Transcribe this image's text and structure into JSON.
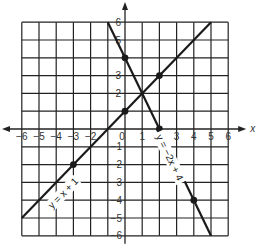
{
  "figure": {
    "x_axis_label": "x",
    "y_axis_label": "y",
    "x_ticks": [
      "−6",
      "−5",
      "−4",
      "−3",
      "−2",
      "0",
      "1",
      "2",
      "3",
      "4",
      "5",
      "6"
    ],
    "y_ticks_pos": [
      "6",
      "5",
      "3",
      "2"
    ],
    "y_ticks_neg": [
      "−1",
      "−2",
      "−3",
      "−4",
      "−5",
      "−6"
    ],
    "line1_label": "y = x + 1",
    "line2_label": "y = −2x + 4"
  },
  "chart_data": {
    "type": "line",
    "title": "",
    "xlabel": "x",
    "ylabel": "y",
    "xlim": [
      -6,
      6
    ],
    "ylim": [
      -6,
      6
    ],
    "grid": true,
    "series": [
      {
        "name": "y = x + 1",
        "equation": "y = x + 1",
        "segment": [
          [
            -6,
            -5
          ],
          [
            5,
            6
          ]
        ],
        "marked_points": [
          [
            -3,
            -2
          ],
          [
            0,
            1
          ],
          [
            2,
            3
          ]
        ]
      },
      {
        "name": "y = -2x + 4",
        "equation": "y = -2x + 4",
        "segment": [
          [
            -1,
            6
          ],
          [
            5,
            -6
          ]
        ],
        "marked_points": [
          [
            0,
            4
          ],
          [
            2,
            0
          ],
          [
            4,
            -4
          ]
        ]
      }
    ],
    "intersection": [
      1,
      2
    ]
  }
}
